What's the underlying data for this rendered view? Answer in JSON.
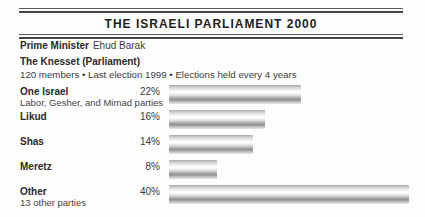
{
  "title": "THE ISRAELI PARLIAMENT 2000",
  "prime_minister": {
    "label": "Prime Minister",
    "value": "Ehud Barak"
  },
  "knesset": {
    "heading": "The Knesset (Parliament)",
    "details": "120 members • Last election 1999 • Elections held every 4 years"
  },
  "colors": {
    "background": "#fdfdfc",
    "rule": "#474747",
    "text": "#2b2b2b",
    "bar_style": "metallic-gray-vertical-gradient",
    "bar_grays": [
      "#a9a9a9",
      "#ffffff",
      "#8f8f8f",
      "#e8e8e8"
    ]
  },
  "chart_data": {
    "type": "bar",
    "orientation": "horizontal",
    "title": "THE ISRAELI PARLIAMENT 2000",
    "xlabel": "",
    "ylabel": "",
    "unit": "%",
    "xlim": [
      0,
      40
    ],
    "grid": false,
    "legend": "none",
    "categories": [
      "One Israel",
      "Likud",
      "Shas",
      "Meretz",
      "Other"
    ],
    "values": [
      22,
      16,
      14,
      8,
      40
    ],
    "value_labels": [
      "22%",
      "16%",
      "14%",
      "8%",
      "40%"
    ],
    "sublabels": [
      "Labor, Gesher, and Mimad parties",
      "",
      "",
      "",
      "13 other parties"
    ]
  }
}
